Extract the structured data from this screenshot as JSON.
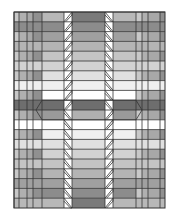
{
  "figure": {
    "frame": {
      "x": 14,
      "y": 12,
      "w": 151,
      "h": 196
    },
    "rows": 20,
    "row_height": 9.8,
    "columns": [
      {
        "name": "left-strip-1",
        "x0": 14,
        "x1": 19
      },
      {
        "name": "left-strip-2",
        "x0": 19,
        "x1": 27
      },
      {
        "name": "left-strip-3",
        "x0": 27,
        "x1": 33
      },
      {
        "name": "left-strip-4",
        "x0": 33,
        "x1": 42
      },
      {
        "name": "left-band",
        "x0": 42,
        "x1": 64
      },
      {
        "name": "left-slant",
        "x0": 64,
        "x1": 72
      },
      {
        "name": "center-band",
        "x0": 72,
        "x1": 105
      },
      {
        "name": "right-slant",
        "x0": 105,
        "x1": 113
      },
      {
        "name": "right-band",
        "x0": 113,
        "x1": 136
      },
      {
        "name": "right-strip-1",
        "x0": 136,
        "x1": 142
      },
      {
        "name": "right-strip-2",
        "x0": 142,
        "x1": 148
      },
      {
        "name": "right-strip-3",
        "x0": 148,
        "x1": 160
      },
      {
        "name": "right-strip-4",
        "x0": 160,
        "x1": 165
      }
    ],
    "band_shades_top_to_bottom": [
      "#b8b8b8",
      "#8c8c8c",
      "#a0a0a0",
      "#b4b4b4",
      "#c4c4c4",
      "#d2d2d2",
      "#e0e0e0",
      "#f0f0f0",
      "#ffffff",
      "#6e6e6e",
      "#9a9a9a",
      "#ffffff",
      "#f0f0f0",
      "#e0e0e0",
      "#d2d2d2",
      "#c4c4c4",
      "#b4b4b4",
      "#a0a0a0",
      "#8c8c8c",
      "#b8b8b8"
    ],
    "center_shades_top_to_bottom": [
      "#7a7a7a",
      "#8c8c8c",
      "#a0a0a0",
      "#b4b4b4",
      "#c4c4c4",
      "#d2d2d2",
      "#e0e0e0",
      "#f0f0f0",
      "#ffffff",
      "#6e6e6e",
      "#b0b0b0",
      "#ffffff",
      "#f0f0f0",
      "#e0e0e0",
      "#d2d2d2",
      "#c4c4c4",
      "#b4b4b4",
      "#a0a0a0",
      "#8c8c8c",
      "#7a7a7a"
    ],
    "strip_shades": [
      "#c8c8c8",
      "#b0b0b0",
      "#a8a8a8",
      "#909090"
    ],
    "line_color": "#333333",
    "slant_fill": "#ffffff"
  }
}
